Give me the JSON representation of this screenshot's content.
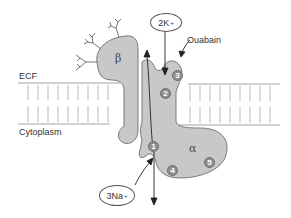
{
  "diagram": {
    "regions": {
      "ecf_label": "ECF",
      "cytoplasm_label": "Cytoplasm"
    },
    "subunits": {
      "beta": "β",
      "alpha": "α"
    },
    "ions": {
      "potassium": {
        "count": "2K",
        "charge": "+"
      },
      "sodium": {
        "count": "3Na",
        "charge": "+"
      }
    },
    "inhibitor_label": "Ouabain",
    "binding_sites": [
      "1",
      "2",
      "3",
      "4",
      "5"
    ],
    "colors": {
      "protein_fill": "#c8c8c8",
      "protein_stroke": "#6e6e6e",
      "site_fill": "#8f8f8f",
      "membrane_line": "#888888",
      "arrow": "#222222"
    }
  }
}
